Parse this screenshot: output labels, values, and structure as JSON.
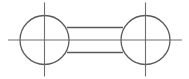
{
  "drawing": {
    "type": "technical-part-drawing",
    "title": "Two-hole link / dumbbell bar part view",
    "canvas": {
      "width": 189,
      "height": 79,
      "background": "#ffffff"
    },
    "style": {
      "outline_color": "#5a5a5a",
      "centerline_color": "#6e6e6e",
      "outline_width": 1.3,
      "centerline_width": 1.1,
      "fill": "none"
    },
    "geometry": {
      "circles": [
        {
          "name": "left-boss",
          "cx": 44.5,
          "cy": 40,
          "r": 24.5
        },
        {
          "name": "right-boss",
          "cx": 145.5,
          "cy": 40,
          "r": 24.5
        }
      ],
      "bar": {
        "name": "connecting-bar",
        "x_start": 67,
        "x_end": 123,
        "top_edge_y": 27.5,
        "bottom_edge_y": 52.5
      },
      "centerlines": {
        "horizontal": {
          "y": 40,
          "x_start": 8,
          "x_end": 182
        },
        "vertical": [
          {
            "x": 44.5,
            "y_start": 2.5,
            "y_end": 76.5
          },
          {
            "x": 145.5,
            "y_start": 2.5,
            "y_end": 76.5
          }
        ]
      }
    },
    "labels": {
      "left_circle": "left-hole-boss",
      "right_circle": "right-hole-boss",
      "bar": "connecting-bar",
      "h_centerline": "horizontal-centerline",
      "v_centerline_left": "left-vertical-centerline",
      "v_centerline_right": "right-vertical-centerline"
    }
  }
}
